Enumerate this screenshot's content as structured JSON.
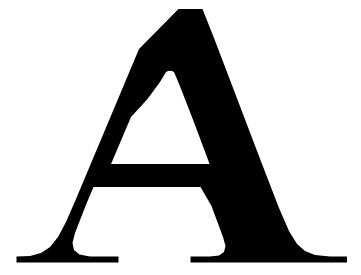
{
  "image": {
    "kind": "glyph-artwork",
    "subject": "letter-A",
    "character": "A",
    "script": "Latin",
    "case": "uppercase",
    "typeface_style": "serif",
    "width_px": 361,
    "height_px": 275
  },
  "colors": {
    "background": "#FFFFFF",
    "glyph": "#000000"
  },
  "geometry": {
    "apex_top_y": 9,
    "apex_left_x": 175,
    "apex_right_x": 205,
    "baseline_y": 262,
    "crossbar_top_y": 170,
    "crossbar_bottom_y": 187,
    "counter_apex_y": 72,
    "left_foot_left_x": 16,
    "left_foot_right_x": 118,
    "right_foot_left_x": 190,
    "right_foot_right_x": 347
  },
  "paths": {
    "outline": "M 178.5 9 L 202.5 9 L 214 38 L 262 164 L 279 208 L 289 231 L 297 244 L 305 251 L 315 255 L 330 256.5 L 347 256.5 L 347 262.5 L 190.5 262.5 L 190.5 256.5 L 210 256.5 L 219 255.5 L 224 252 L 225.5 246 L 223 237 L 211.5 206 L 200.5 187 L 93.5 187 L 85.5 206 L 75 233 L 72.5 243 L 74 250 L 79.5 254.5 L 90 256.5 L 118.5 256.5 L 118.5 262.5 L 16.5 262.5 L 16.5 256.5 L 30 256 L 41 253 L 50 247 L 58 237 L 66 222 L 76 199 L 139 49 Z",
    "counter": "M 166 72 Q 170 69.5 174 72 L 179.5 85 L 193.5 121 L 207 157 L 209.5 164 L 111 164 L 114 157 L 131 117 L 147.5 99 L 160 82 Z"
  },
  "labels": {
    "title": "Capital letter A"
  }
}
